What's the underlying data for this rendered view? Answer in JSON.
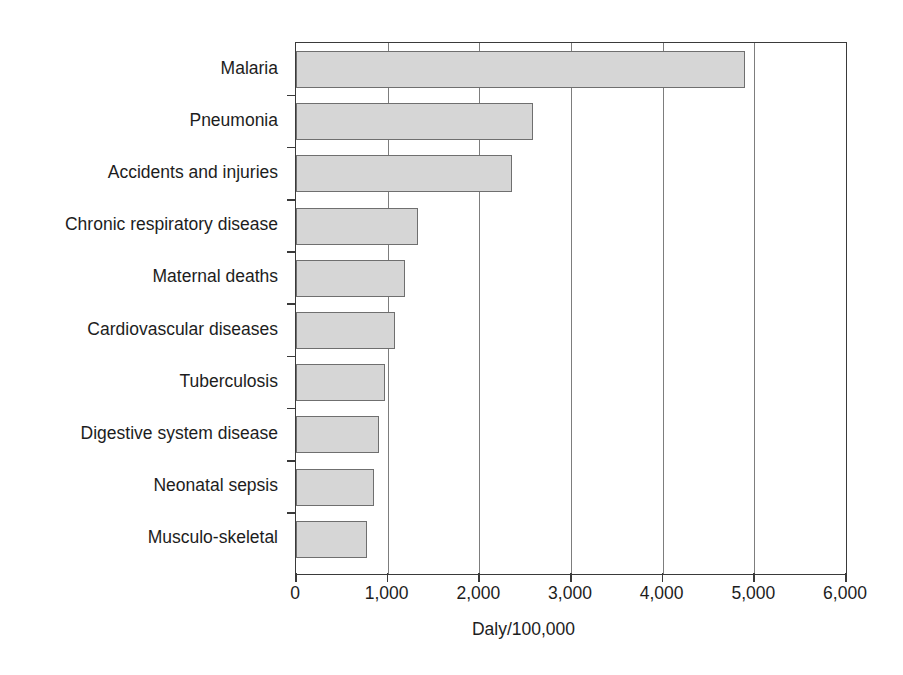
{
  "chart_data": {
    "type": "bar",
    "orientation": "horizontal",
    "title": "",
    "xlabel": "Daly/100,000",
    "ylabel": "",
    "xlim": [
      0,
      6000
    ],
    "xticks": [
      0,
      1000,
      2000,
      3000,
      4000,
      5000,
      6000
    ],
    "xtick_labels": [
      "0",
      "1,000",
      "2,000",
      "3,000",
      "4,000",
      "5,000",
      "6,000"
    ],
    "grid": true,
    "grid_axis": "x",
    "legend": false,
    "categories": [
      "Malaria",
      "Pneumonia",
      "Accidents and injuries",
      "Chronic respiratory disease",
      "Maternal deaths",
      "Cardiovascular diseases",
      "Tuberculosis",
      "Digestive system disease",
      "Neonatal sepsis",
      "Musculo-skeletal"
    ],
    "values": [
      4900,
      2580,
      2360,
      1330,
      1185,
      1080,
      970,
      905,
      850,
      775
    ],
    "bar_fill_color": "#d6d6d6",
    "bar_edge_color": "#6f6f6f",
    "axis_color": "#3a3a3a",
    "grid_color": "#7d7d7d"
  }
}
